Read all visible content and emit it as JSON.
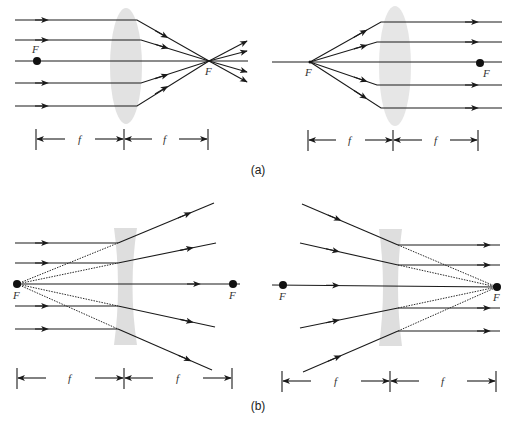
{
  "figure": {
    "panel_a": {
      "caption": "(a)",
      "converging": {
        "focal_label_left": "F",
        "focal_label_right": "F",
        "dim_label_1": "f",
        "dim_label_2": "f"
      },
      "diverging_source": {
        "focal_label_left": "F",
        "focal_label_right": "F",
        "dim_label_1": "f",
        "dim_label_2": "f"
      }
    },
    "panel_b": {
      "caption": "(b)",
      "diverging": {
        "focal_label_left": "F",
        "focal_label_right": "F",
        "dim_label_1": "f",
        "dim_label_2": "f"
      },
      "converging_to_focus": {
        "focal_label_left": "F",
        "focal_label_right": "F",
        "dim_label_1": "f",
        "dim_label_2": "f"
      }
    }
  },
  "colors": {
    "ray": "#1a1a1a",
    "lens": "#dcdcdc",
    "background": "#ffffff"
  }
}
